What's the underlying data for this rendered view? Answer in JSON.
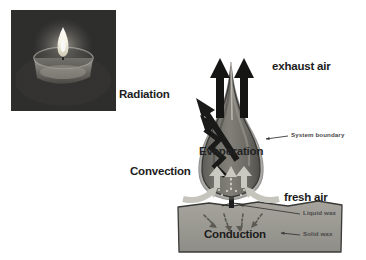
{
  "figure": {
    "background_color": "#ffffff",
    "width": 366,
    "height": 260
  },
  "photo": {
    "name": "tealight-candle-photograph",
    "subject": "lit tealight candle in aluminium cup",
    "frame_color": "#2e2e2e",
    "flame_color": "#fdfbf0",
    "cup_color": "#8d8b84"
  },
  "labels": {
    "exhaust_air": "exhaust air",
    "radiation": "Radiation",
    "convection": "Convection",
    "evaporation": "Evaporation",
    "conduction": "Conduction",
    "fresh_air": "fresh air",
    "system_boundary": "System boundary",
    "liquid_wax": "Liquid wax",
    "solid_wax": "Solid wax"
  },
  "colors": {
    "text_dark": "#1c1c1c",
    "text_gray": "#4a4a4a",
    "flame_body": "#7b7a74",
    "flame_outline": "#3f3e3b",
    "flame_inner": "#595853",
    "wax_block": "#9a9993",
    "wax_outline": "#3a3a38",
    "arrow_black": "#171717",
    "arrow_light": "#cfcec8",
    "wick": "#1d1d1d"
  },
  "arrows": {
    "exhaust_left": "upward-black-arrow",
    "exhaust_right": "upward-black-arrow",
    "radiation": "straight-black-arrow-up-left",
    "convection": "zigzag-black-arrow-up-left",
    "evaporation_1": "light-upward-arrow",
    "evaporation_2": "light-upward-arrow",
    "evaporation_3": "light-upward-arrow",
    "fresh_air_left": "curved-light-inflow-arrow",
    "fresh_air_right": "curved-light-inflow-arrow",
    "conduction_1": "dotted-downward-arrow",
    "conduction_2": "dotted-downward-arrow",
    "conduction_3": "dotted-downward-arrow",
    "conduction_4": "dotted-downward-arrow",
    "system_boundary_pointer": "leader-line-left",
    "liquid_wax_pointer": "leader-line-left",
    "solid_wax_pointer": "leader-line-left"
  }
}
